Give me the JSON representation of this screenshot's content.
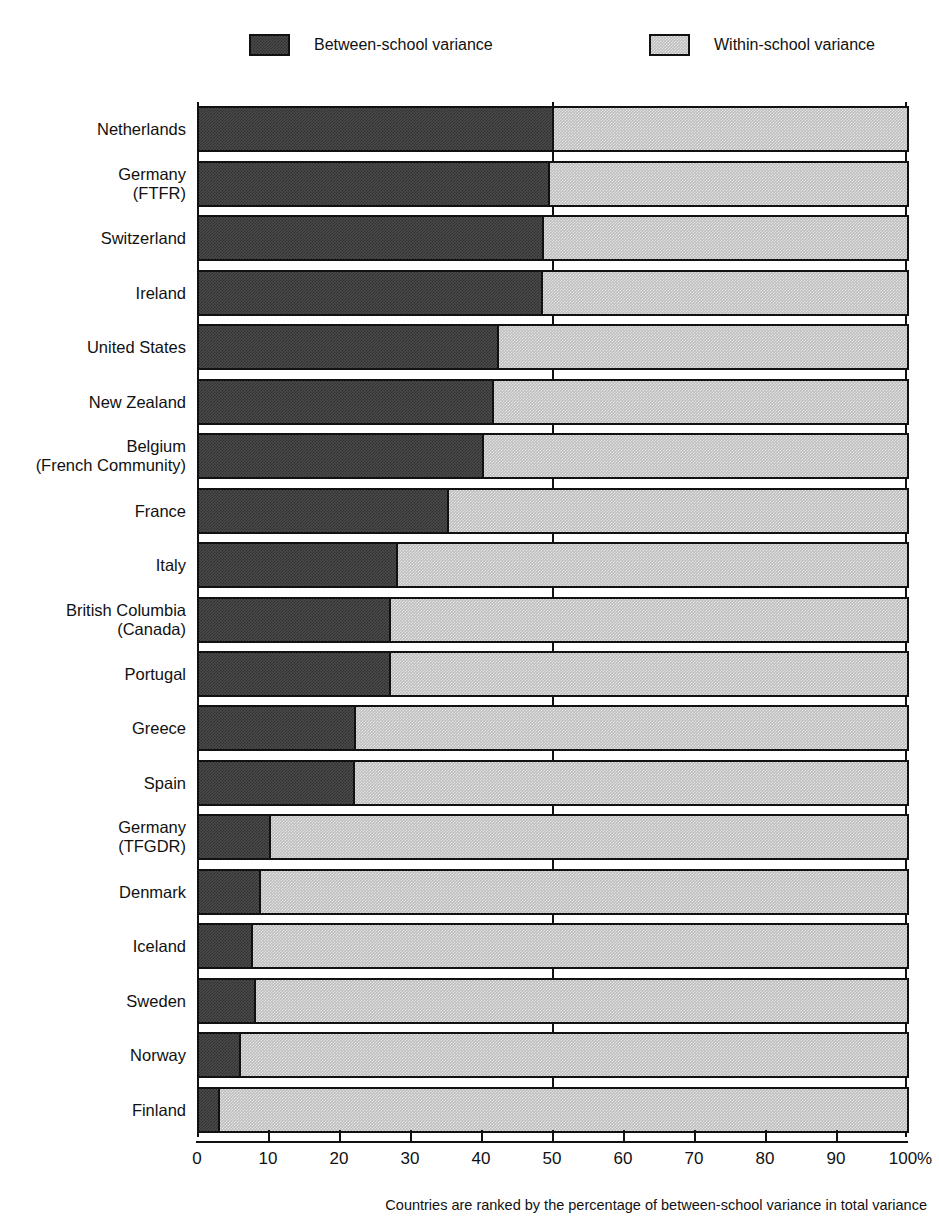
{
  "legend": {
    "items": [
      {
        "label": "Between-school variance",
        "color": "#4a4a4a",
        "swatch": "dark-hatch-swatch"
      },
      {
        "label": "Within-school variance",
        "color": "#bdbdbd",
        "swatch": "light-hatch-swatch"
      }
    ]
  },
  "footnote": "Countries are ranked by the percentage of between-school variance in total variance",
  "axis": {
    "tick_labels": [
      "0",
      "10",
      "20",
      "30",
      "40",
      "50",
      "60",
      "70",
      "80",
      "90",
      "100%"
    ],
    "tick_values": [
      0,
      10,
      20,
      30,
      40,
      50,
      60,
      70,
      80,
      90,
      100
    ]
  },
  "background_artifacts": {
    "line1": "",
    "line2": "",
    "line3": ""
  },
  "chart_data": {
    "type": "bar",
    "orientation": "horizontal",
    "stacked": true,
    "normalized_percent": true,
    "title": "",
    "subtitle": "",
    "xlabel": "",
    "ylabel": "",
    "xlim": [
      0,
      100
    ],
    "grid": false,
    "reference_line": 50,
    "legend_position": "top",
    "note": "Countries are ranked by the percentage of between-school variance in total variance",
    "categories": [
      "Netherlands",
      "Germany\n(FTFR)",
      "Switzerland",
      "Ireland",
      "United States",
      "New Zealand",
      "Belgium\n(French Community)",
      "France",
      "Italy",
      "British Columbia\n(Canada)",
      "Portugal",
      "Greece",
      "Spain",
      "Germany\n(TFGDR)",
      "Denmark",
      "Iceland",
      "Sweden",
      "Norway",
      "Finland"
    ],
    "series": [
      {
        "name": "Between-school variance",
        "color": "#4a4a4a",
        "values": [
          50.0,
          49.4,
          48.6,
          48.4,
          42.3,
          41.5,
          40.2,
          35.2,
          28.0,
          27.1,
          27.0,
          22.1,
          22.0,
          10.1,
          8.8,
          7.6,
          8.0,
          5.9,
          3.0
        ]
      },
      {
        "name": "Within-school variance",
        "color": "#bdbdbd",
        "values": [
          50.0,
          50.6,
          51.4,
          51.6,
          57.7,
          58.5,
          59.8,
          64.8,
          72.0,
          72.9,
          73.0,
          77.9,
          78.0,
          89.9,
          91.2,
          92.4,
          92.0,
          94.1,
          97.0
        ]
      }
    ]
  }
}
